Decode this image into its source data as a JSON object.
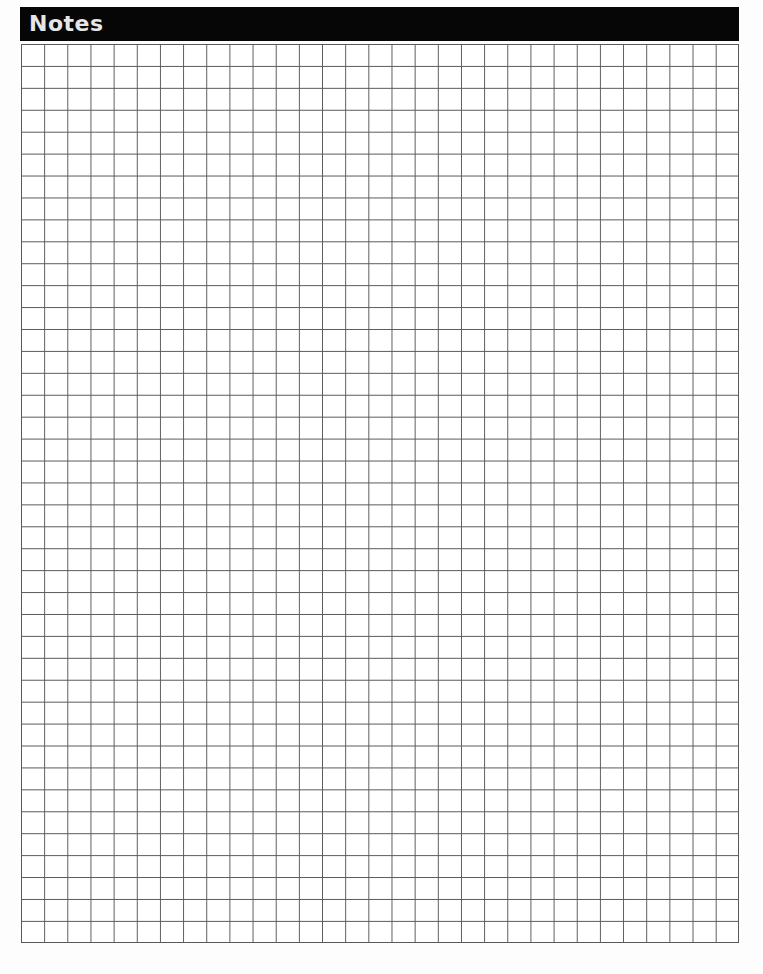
{
  "header": {
    "title": "Notes",
    "background_color": "#060606",
    "text_color": "#e6e6e6"
  },
  "grid": {
    "columns": 31,
    "rows": 41,
    "line_color": "#5a5a5a"
  }
}
